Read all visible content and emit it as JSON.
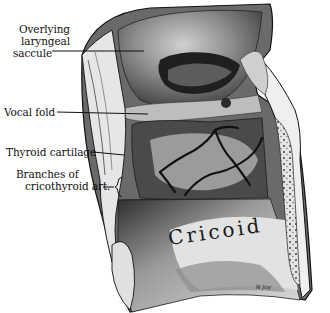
{
  "figure": {
    "type": "anatomical-illustration",
    "labels": [
      {
        "id": "saccule",
        "lines": [
          "Overlying",
          "laryngeal",
          "saccule"
        ]
      },
      {
        "id": "vocal-fold",
        "lines": [
          "Vocal fold"
        ]
      },
      {
        "id": "thyroid-cartilage",
        "lines": [
          "Thyroid cartilage"
        ]
      },
      {
        "id": "cricothyroid-branches",
        "lines": [
          "Branches of",
          "cricothyroid art."
        ]
      }
    ],
    "inline_text": "Cricoid",
    "signature": "N Joy"
  },
  "colors": {
    "background": "#ffffff",
    "ink": "#111111",
    "tissue_dark": "#3a3a3a",
    "tissue_mid": "#8a8a8a",
    "tissue_light": "#d8d8d8"
  }
}
